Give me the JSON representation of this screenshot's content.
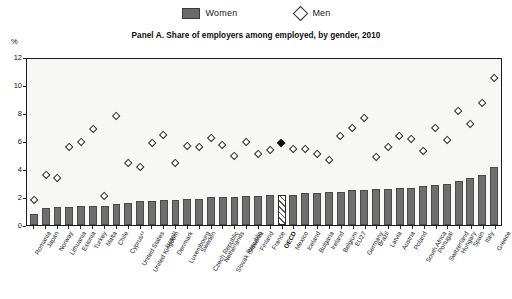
{
  "legend": {
    "items": [
      {
        "label": "Women",
        "marker": "filled-square-swatch",
        "color": "#6b6b6b"
      },
      {
        "label": "Men",
        "marker": "open-diamond",
        "color": "#ffffff"
      }
    ]
  },
  "title": "Panel A. Share of employers among employed, by gender, 2010",
  "axis_unit": "%",
  "highlight": {
    "category": "OECD",
    "style": "hatched-bar-and-filled-diamond"
  },
  "chart_data": {
    "type": "bar",
    "title": "Panel A. Share of employers among employed, by gender, 2010",
    "xlabel": "",
    "ylabel": "%",
    "ylim": [
      0,
      12
    ],
    "yticks": [
      0,
      2,
      4,
      6,
      8,
      10,
      12
    ],
    "grid": false,
    "legend_position": "top-center",
    "categories": [
      "Romania",
      "Japan",
      "Norway",
      "Lithuania",
      "Estonia",
      "Turkey",
      "Malta",
      "Chile",
      "Cyprus¹²",
      "United States",
      "United Kingdom",
      "Israel³",
      "Denmark",
      "Luxembourg",
      "Sweden",
      "Czech Republic",
      "Netherlands",
      "Slovak Republic",
      "Slovenia",
      "Finland",
      "France",
      "OECD",
      "Mexico",
      "Iceland",
      "Bulgaria",
      "Ireland",
      "Belgium",
      "EU27",
      "Germany",
      "Brazil",
      "Latvia",
      "Austria",
      "Poland",
      "South Africa",
      "Portugal",
      "Switzerland",
      "Hungary",
      "Spain",
      "Italy",
      "Greece"
    ],
    "series": [
      {
        "name": "Women",
        "marker": "bar",
        "values": [
          0.8,
          1.2,
          1.3,
          1.3,
          1.4,
          1.4,
          1.4,
          1.5,
          1.6,
          1.7,
          1.7,
          1.8,
          1.8,
          1.9,
          1.9,
          2.0,
          2.0,
          2.0,
          2.1,
          2.1,
          2.2,
          2.2,
          2.2,
          2.3,
          2.3,
          2.4,
          2.4,
          2.5,
          2.5,
          2.6,
          2.6,
          2.7,
          2.7,
          2.8,
          2.9,
          3.0,
          3.2,
          3.4,
          3.6,
          4.2
        ]
      },
      {
        "name": "Men",
        "marker": "diamond",
        "values": [
          1.8,
          3.6,
          3.4,
          5.6,
          6.0,
          6.9,
          2.1,
          7.9,
          4.5,
          4.2,
          5.9,
          6.5,
          4.5,
          5.7,
          5.6,
          6.3,
          5.8,
          5.0,
          6.0,
          5.1,
          5.4,
          5.9,
          5.5,
          5.5,
          5.1,
          4.7,
          6.4,
          7.0,
          7.7,
          4.9,
          5.6,
          6.4,
          6.2,
          5.3,
          7.0,
          6.1,
          8.2,
          7.3,
          8.8,
          10.6
        ]
      }
    ]
  }
}
